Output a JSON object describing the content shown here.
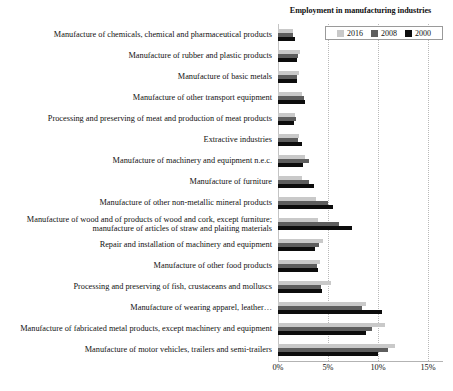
{
  "chart_data": {
    "type": "bar",
    "orientation": "horizontal",
    "title": "Employment in manufacturing industries",
    "xlabel": "",
    "ylabel": "",
    "xlim": [
      0,
      16.5
    ],
    "xticks": [
      "0%",
      "5%",
      "10%",
      "15%"
    ],
    "xtick_values": [
      0,
      5,
      10,
      15
    ],
    "grid": true,
    "legend_position": "top-right",
    "categories": [
      "Manufacture of chemicals, chemical and pharmaceutical products",
      "Manufacture of rubber and plastic products",
      "Manufacture of basic metals",
      "Manufacture of other transport equipment",
      "Processing and preserving of meat and production of meat products",
      "Extractive industries",
      "Manufacture of machinery and equipment n.e.c.",
      "Manufacture of furniture",
      "Manufacture of other non-metallic mineral products",
      "Manufacture of wood and of products of wood and cork, except furniture; manufacture of articles of straw and plaiting materials",
      "Repair and installation of machinery and equipment",
      "Manufacture of other food products",
      "Processing and preserving of fish, crustaceans and molluscs",
      "Manufacture of wearing apparel, leather…",
      "Manufacture of fabricated metal products, except machinery and equipment",
      "Manufacture of motor vehicles, trailers and semi-trailers"
    ],
    "series": [
      {
        "name": "2016",
        "color": "#c9c9c9",
        "values": [
          1.5,
          2.2,
          2.1,
          2.4,
          1.7,
          2.1,
          2.7,
          2.4,
          3.8,
          4.0,
          4.5,
          4.2,
          5.3,
          8.8,
          10.7,
          11.7
        ]
      },
      {
        "name": "2008",
        "color": "#5e5e5e",
        "values": [
          1.5,
          2.0,
          1.9,
          2.6,
          1.8,
          2.0,
          3.1,
          3.1,
          5.0,
          6.1,
          4.1,
          3.9,
          4.3,
          8.4,
          9.4,
          11.0
        ]
      },
      {
        "name": "2000",
        "color": "#0d0d0d",
        "values": [
          1.7,
          1.9,
          1.9,
          2.7,
          1.6,
          2.4,
          2.5,
          3.6,
          5.5,
          7.4,
          3.7,
          4.0,
          4.4,
          10.4,
          8.8,
          10.0
        ]
      }
    ]
  },
  "legend": {
    "items": [
      {
        "label": "2016",
        "color": "#c9c9c9"
      },
      {
        "label": "2008",
        "color": "#5e5e5e"
      },
      {
        "label": "2000",
        "color": "#0d0d0d"
      }
    ]
  },
  "footnote": ""
}
